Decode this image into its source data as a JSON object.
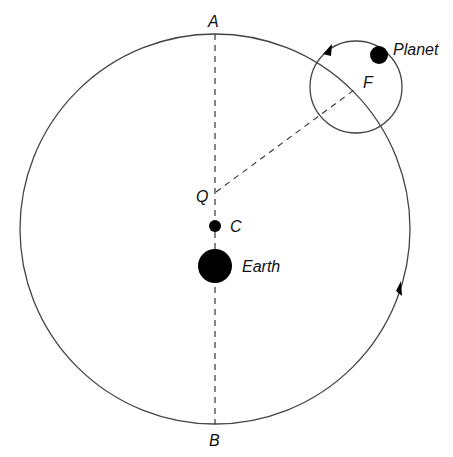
{
  "diagram": {
    "labels": {
      "A": "A",
      "B": "B",
      "F": "F",
      "Q": "Q",
      "C": "C",
      "earth": "Earth",
      "planet": "Planet"
    },
    "elements": {
      "deferent": {
        "cx": 215,
        "cy": 229,
        "r": 195
      },
      "epicycle": {
        "cx": 356,
        "cy": 87,
        "r": 46
      },
      "earth": {
        "cx": 215,
        "cy": 266,
        "r": 17
      },
      "center_C": {
        "cx": 215,
        "cy": 226,
        "r": 6
      },
      "equant_Q": {
        "x": 215,
        "y": 193
      },
      "planet": {
        "cx": 379,
        "cy": 55,
        "r": 9
      },
      "axis_A_to_B": "dashed vertical line",
      "line_Q_to_F": "dashed line"
    },
    "colors": {
      "stroke": "#444444",
      "fill": "#000000",
      "background": "#ffffff"
    }
  }
}
